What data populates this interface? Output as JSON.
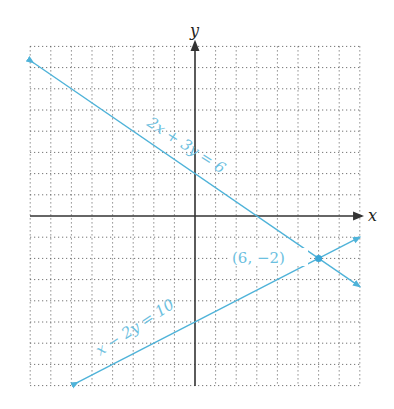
{
  "chart_data": {
    "type": "line",
    "title": "",
    "xlabel": "x",
    "ylabel": "y",
    "xlim": [
      -8,
      8
    ],
    "ylim": [
      -8,
      8
    ],
    "grid": true,
    "grid_style": "dotted",
    "grid_step": 1,
    "series": [
      {
        "name": "2x + 3y = 6",
        "label": "2x + 3y = 6",
        "equation": "2x + 3y = 6",
        "color": "#4fb3d9",
        "points": [
          [
            -7.86,
            7.24
          ],
          [
            8,
            -3.33
          ]
        ],
        "intercepts": {
          "y": 2,
          "x": 3
        },
        "arrows": "both"
      },
      {
        "name": "x - 2y = 10",
        "label": "x − 2y = 10",
        "equation": "x - 2y = 10",
        "color": "#4fb3d9",
        "points": [
          [
            -5.7,
            -7.85
          ],
          [
            8,
            -1
          ]
        ],
        "intercepts": {
          "y": -5,
          "x": 10
        },
        "arrows": "both"
      }
    ],
    "annotations": [
      {
        "text": "(6, −2)",
        "point": [
          6,
          -2
        ],
        "type": "intersection-point"
      }
    ]
  },
  "labels": {
    "x_axis": "x",
    "y_axis": "y",
    "line1": "2x + 3y = 6",
    "line2": "x − 2y = 10",
    "intersection": "(6, −2)"
  },
  "colors": {
    "line": "#4fb3d9",
    "axis": "#333333",
    "grid": "#555555",
    "point": "#3aa6d6"
  }
}
